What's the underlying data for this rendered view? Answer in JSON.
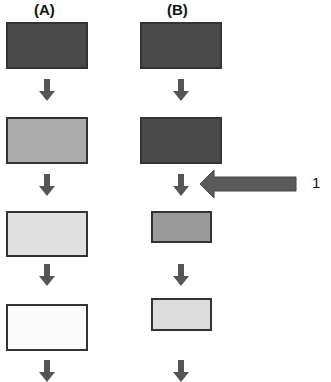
{
  "columns": [
    {
      "label": "(A)",
      "boxes": [
        {
          "shade": "dark",
          "color": "#4a4a4a"
        },
        {
          "shade": "medium",
          "color": "#ababab"
        },
        {
          "shade": "light",
          "color": "#e0e0e0"
        },
        {
          "shade": "lightest",
          "color": "#fbfbfb"
        }
      ]
    },
    {
      "label": "(B)",
      "boxes": [
        {
          "shade": "dark",
          "color": "#4a4a4a"
        },
        {
          "shade": "dark",
          "color": "#4a4a4a"
        },
        {
          "shade": "medium",
          "color": "#9a9a9a"
        },
        {
          "shade": "light",
          "color": "#dcdcdc"
        }
      ]
    }
  ],
  "annotation": {
    "label": "1",
    "arrow_color": "#5a5a5a",
    "points_to": "arrow between (B) box 2 and box 3"
  },
  "colors": {
    "border": "#333333",
    "small_arrow": "#555555"
  }
}
